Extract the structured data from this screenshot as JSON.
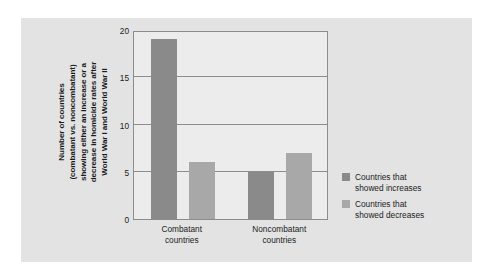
{
  "chart_data": {
    "type": "bar",
    "title": "",
    "xlabel": "",
    "ylabel": "Number of countries\n(combatant vs. noncombatant)\nshowing either an increase or a\ndecrease in homicide rates after\nWorld War I and World War II",
    "categories": [
      "Combatant\ncountries",
      "Noncombatant\ncountries"
    ],
    "series": [
      {
        "name": "Countries that\nshowed increases",
        "values": [
          19,
          5
        ],
        "color": "#8a8a8a"
      },
      {
        "name": "Countries that\nshowed decreases",
        "values": [
          6,
          7
        ],
        "color": "#a8a8a8"
      }
    ],
    "ylim": [
      0,
      20
    ],
    "yticks": [
      20,
      15,
      10,
      5,
      0
    ],
    "grid": true,
    "legend_position": "right"
  },
  "colors": {
    "page_background": "#ffffff",
    "panel_background": "#e3e3e3",
    "plot_background": "#ececec",
    "axis": "#8c8c8c",
    "text": "#1b1b1b"
  }
}
